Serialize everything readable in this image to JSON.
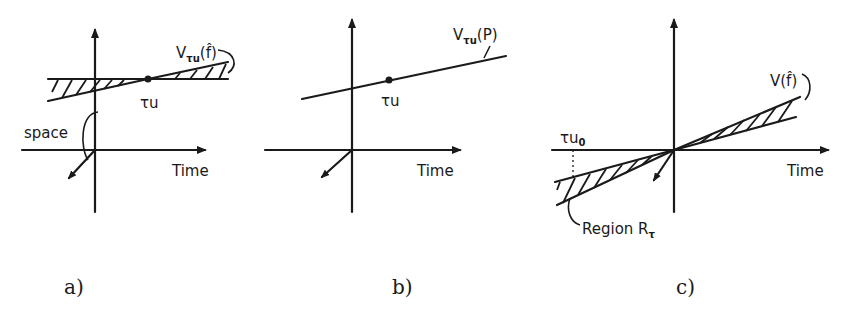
{
  "figure": {
    "panels": [
      {
        "id": "a",
        "caption": "a)",
        "x_axis_label": "Time",
        "space_label": "space",
        "point_label": "τu",
        "region_label_main": "V",
        "region_label_sub": "τu",
        "region_label_arg": "(f̂)",
        "hatched": true
      },
      {
        "id": "b",
        "caption": "b)",
        "x_axis_label": "Time",
        "point_label": "τu",
        "line_label_main": "V",
        "line_label_sub": "τu",
        "line_label_arg": "(P)",
        "hatched": false
      },
      {
        "id": "c",
        "caption": "c)",
        "x_axis_label": "Time",
        "tick_label_main": "τu",
        "tick_label_sub": "0",
        "cone_label": "V(f̂)",
        "region_label_main": "Region R",
        "region_label_sub": "τ",
        "hatched": true
      }
    ]
  }
}
